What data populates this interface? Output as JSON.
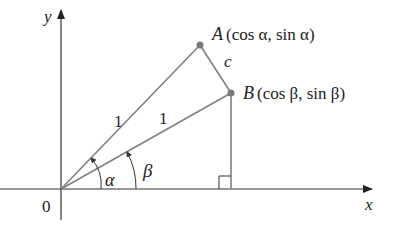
{
  "diagram": {
    "type": "unit-circle-angle-difference",
    "colors": {
      "axis": "#333333",
      "segment": "#808080",
      "point": "#7a7a7a",
      "text": "#222222"
    },
    "axes": {
      "x_label": "x",
      "y_label": "y",
      "origin_label": "0"
    },
    "points": {
      "A": {
        "name": "A",
        "coords": "(cos α, sin α)"
      },
      "B": {
        "name": "B",
        "coords": "(cos β, sin β)"
      }
    },
    "segment_labels": {
      "OA": "1",
      "OB": "1",
      "AB": "c"
    },
    "angles": {
      "alpha": "α",
      "beta": "β"
    }
  }
}
